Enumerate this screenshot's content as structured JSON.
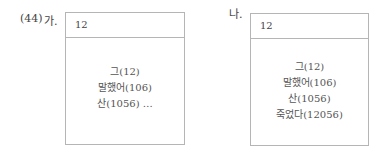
{
  "example_number": "(44)",
  "panels": [
    {
      "label": "가.",
      "header": "12",
      "lines": [
        "그(12)",
        "말했어(106)",
        "산(1056) …"
      ]
    },
    {
      "label": "나.",
      "header": "12",
      "lines": [
        "그(12)",
        "말했어(106)",
        "산(1056)",
        "죽었다(12056)"
      ]
    }
  ]
}
